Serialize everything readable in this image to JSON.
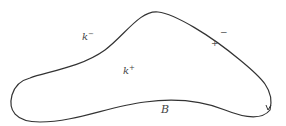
{
  "diagram": {
    "curve": {
      "label": "B",
      "stroke": "#333333",
      "direction_arrow": "counterclockwise-up"
    },
    "labels": {
      "outside": {
        "base": "k",
        "sup": "−"
      },
      "inside": {
        "base": "k",
        "sup": "+"
      },
      "boundary_minus": "−",
      "boundary_plus": "+"
    }
  }
}
